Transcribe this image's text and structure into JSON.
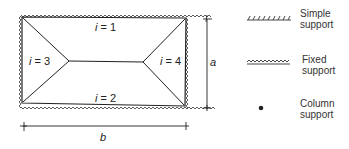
{
  "diagram": {
    "panels": [
      {
        "id": "i1",
        "label": "i = 1"
      },
      {
        "id": "i2",
        "label": "i = 2"
      },
      {
        "id": "i3",
        "label": "i = 3"
      },
      {
        "id": "i4",
        "label": "i = 4"
      }
    ],
    "dimensions": {
      "height_label": "a",
      "width_label": "b"
    }
  },
  "legend": {
    "items": [
      {
        "symbol": "hatched-line",
        "line1": "Simple",
        "line2": "support"
      },
      {
        "symbol": "zigzag-line",
        "line1": "Fixed",
        "line2": "support"
      },
      {
        "symbol": "dot",
        "line1": "Column",
        "line2": "support"
      }
    ]
  }
}
